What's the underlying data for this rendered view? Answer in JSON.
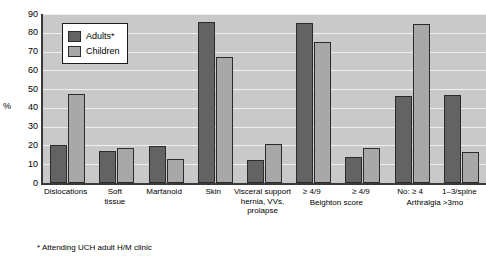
{
  "chart_data": {
    "type": "bar",
    "title": "",
    "xlabel": "",
    "ylabel": "%",
    "ylim": [
      0,
      90
    ],
    "yticks": [
      0,
      10,
      20,
      30,
      40,
      50,
      60,
      70,
      80,
      90
    ],
    "grid": true,
    "legend_position": "top-left-inside",
    "categories": [
      "Dislocations",
      "Soft tissue",
      "Marfanoid",
      "Skin",
      "Visceral support hernia, VVs, prolapse",
      "≥ 4/9",
      "≥ 4/9",
      "No: ≥ 4",
      "1–3/spine"
    ],
    "category_lines": [
      [
        "Dislocations"
      ],
      [
        "Soft",
        "tissue"
      ],
      [
        "Marfanoid"
      ],
      [
        "Skin"
      ],
      [
        "Visceral support",
        "hernia, VVs,",
        "prolapse"
      ],
      [
        "≥ 4/9"
      ],
      [
        "≥ 4/9"
      ],
      [
        "No: ≥ 4"
      ],
      [
        "1–3/spine"
      ]
    ],
    "supergroups": [
      {
        "label": "Beighton score",
        "start_index": 5,
        "end_index": 6
      },
      {
        "label": "Arthralgia >3mo",
        "start_index": 7,
        "end_index": 8
      }
    ],
    "series": [
      {
        "name": "Adults*",
        "color": "#636363",
        "values": [
          20,
          17,
          19.5,
          85.5,
          12,
          85,
          14,
          46.5,
          47
        ]
      },
      {
        "name": "Children",
        "color": "#a8a8a8",
        "values": [
          47.5,
          18.5,
          13,
          67,
          21,
          75,
          18.5,
          84.5,
          16.5
        ]
      }
    ],
    "footnote": "* Attending UCH adult H/M clinic"
  },
  "legend": {
    "items": [
      {
        "label": "Adults*",
        "color": "#636363"
      },
      {
        "label": "Children",
        "color": "#a8a8a8"
      }
    ]
  },
  "colors": {
    "plot_background": "#c9c9c9",
    "gridline": "#efefef",
    "axis": "#3a3a3a",
    "adults": "#636363",
    "children": "#a8a8a8",
    "page_background": "#ffffff"
  }
}
